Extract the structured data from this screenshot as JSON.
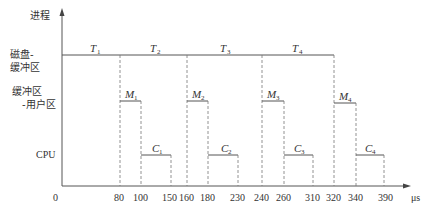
{
  "diagram": {
    "type": "timing-diagram",
    "y_axis_label": "进程",
    "x_axis_unit": "μs",
    "origin_label": "0",
    "rows": [
      {
        "label_line1": "磁盘-",
        "label_line2": "缓冲区"
      },
      {
        "label_line1": "缓冲区",
        "label_line2": "-用户区"
      },
      {
        "label_line1": "CPU",
        "label_line2": ""
      }
    ],
    "ticks": [
      "80",
      "100",
      "150",
      "160",
      "180",
      "230",
      "240",
      "260",
      "310",
      "320",
      "340",
      "390"
    ],
    "disk_segments": [
      {
        "name": "T",
        "sub": "1",
        "start": 0,
        "end": 80
      },
      {
        "name": "T",
        "sub": "2",
        "start": 80,
        "end": 160
      },
      {
        "name": "T",
        "sub": "3",
        "start": 160,
        "end": 240
      },
      {
        "name": "T",
        "sub": "4",
        "start": 240,
        "end": 320
      }
    ],
    "move_segments": [
      {
        "name": "M",
        "sub": "1",
        "start": 80,
        "end": 100
      },
      {
        "name": "M",
        "sub": "2",
        "start": 160,
        "end": 180
      },
      {
        "name": "M",
        "sub": "3",
        "start": 240,
        "end": 260
      },
      {
        "name": "M",
        "sub": "4",
        "start": 320,
        "end": 340
      }
    ],
    "cpu_segments": [
      {
        "name": "C",
        "sub": "1",
        "start": 100,
        "end": 150
      },
      {
        "name": "C",
        "sub": "2",
        "start": 180,
        "end": 230
      },
      {
        "name": "C",
        "sub": "3",
        "start": 260,
        "end": 310
      },
      {
        "name": "C",
        "sub": "4",
        "start": 340,
        "end": 390
      }
    ]
  }
}
